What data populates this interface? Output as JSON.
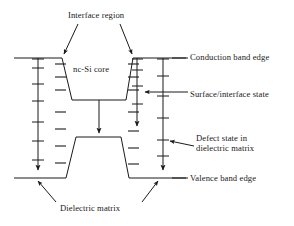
{
  "figure": {
    "type": "energy-band-diagram",
    "stroke_color": "#1a1a1a",
    "background_color": "#ffffff"
  },
  "labels": {
    "interface_region": "Interface region",
    "nc_si_core": "nc-Si core",
    "conduction_band_edge": "Conduction band edge",
    "surface_interface_state": "Surface/interface state",
    "defect_state_line1": "Defect state in",
    "defect_state_line2": "dielectric matrix",
    "valence_band_edge": "Valence band edge",
    "dielectric_matrix": "Dielectric matrix"
  },
  "bands": {
    "conduction_band_edge_y": 58,
    "conduction_well_bottom_y": 100,
    "valence_band_edge_y": 178,
    "valence_barrier_top_y": 137,
    "well_left_top_x": 62,
    "well_right_top_x": 133,
    "well_left_bottom_x": 72,
    "well_right_bottom_x": 126,
    "plot_left_x": 14,
    "plot_right_x": 186
  },
  "state_levels": {
    "left_matrix_defect_ticks_y": [
      68,
      83,
      100,
      121,
      140,
      160
    ],
    "left_interface_dashes_y": [
      66,
      79,
      92,
      112,
      128,
      146,
      162
    ],
    "right_interface_dashes_y": [
      66,
      79,
      92,
      112,
      130,
      148,
      164
    ],
    "right_short_arrow_ticks_y": [
      70,
      86,
      104
    ],
    "right_long_arrow_ticks_y": [
      76,
      96,
      118,
      140,
      156
    ]
  },
  "arrows": {
    "interface_region_left_target": "well-left-edge",
    "interface_region_right_target": "well-right-edge",
    "surface_state_points_to": "right-interface-dash",
    "defect_state_points_to": "right-defect-line",
    "dielectric_matrix_left_target": "valence-band-left",
    "dielectric_matrix_right_target": "valence-band-right",
    "vertical_transition_arrow": "conduction-well-to-valence-barrier"
  }
}
